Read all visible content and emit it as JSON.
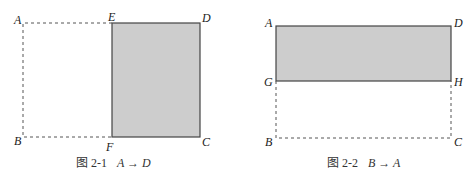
{
  "figures": [
    {
      "caption": {
        "label": "图 2-1",
        "expr": "A → D"
      },
      "points": {
        "A": "A",
        "E": "E",
        "D": "D",
        "B": "B",
        "F": "F",
        "C": "C"
      },
      "shaded_region": "EDCF",
      "dashed_region": "AEFB"
    },
    {
      "caption": {
        "label": "图 2-2",
        "expr": "B → A"
      },
      "points": {
        "A": "A",
        "D": "D",
        "G": "G",
        "H": "H",
        "B": "B",
        "C": "C"
      },
      "shaded_region": "ADHG",
      "dashed_region": "GHCB"
    }
  ],
  "colors": {
    "shade": "#cfcfcf",
    "line": "#444444"
  }
}
